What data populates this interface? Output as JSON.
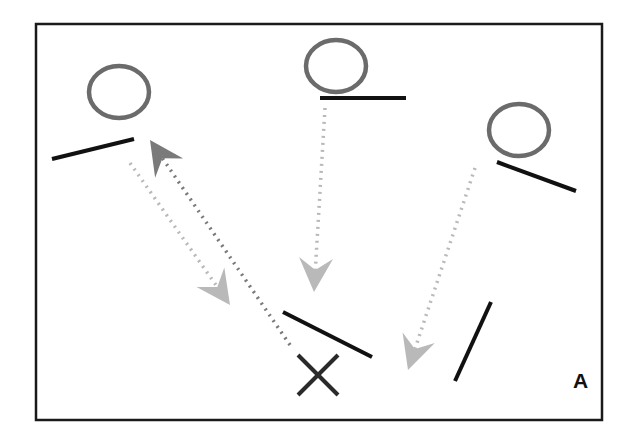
{
  "diagram": {
    "panel_label": "A",
    "colors": {
      "frame": "#1a1a1a",
      "circle": "#6b6b6b",
      "bar": "#111111",
      "arrow_light": "#b9b9b9",
      "arrow_dark": "#7a7a7a",
      "marker": "#2a2a2a"
    },
    "frame": {
      "x": 36,
      "y": 24,
      "w": 566,
      "h": 396
    },
    "circles": [
      {
        "id": "left",
        "cx": 119,
        "cy": 92,
        "rx": 30,
        "ry": 26
      },
      {
        "id": "middle",
        "cx": 336,
        "cy": 66,
        "rx": 30,
        "ry": 26
      },
      {
        "id": "right",
        "cx": 519,
        "cy": 130,
        "rx": 30,
        "ry": 26
      }
    ],
    "bars": [
      {
        "id": "left-bar",
        "x1": 52,
        "y1": 159,
        "x2": 134,
        "y2": 139
      },
      {
        "id": "middle-bar",
        "x1": 320,
        "y1": 98,
        "x2": 406,
        "y2": 98
      },
      {
        "id": "right-bar",
        "x1": 497,
        "y1": 162,
        "x2": 576,
        "y2": 191
      },
      {
        "id": "center-low-bar",
        "x1": 283,
        "y1": 312,
        "x2": 372,
        "y2": 357
      },
      {
        "id": "right-low-bar",
        "x1": 455,
        "y1": 381,
        "x2": 491,
        "y2": 302
      }
    ],
    "arrows": [
      {
        "id": "left-down",
        "tone": "light",
        "x1": 130,
        "y1": 163,
        "x2": 230,
        "y2": 305
      },
      {
        "id": "left-up",
        "tone": "dark",
        "x1": 290,
        "y1": 345,
        "x2": 150,
        "y2": 140
      },
      {
        "id": "middle-down",
        "tone": "light",
        "x1": 325,
        "y1": 108,
        "x2": 314,
        "y2": 292
      },
      {
        "id": "right-down",
        "tone": "light",
        "x1": 475,
        "y1": 168,
        "x2": 408,
        "y2": 370
      }
    ],
    "marker": {
      "id": "x-marker",
      "cx": 318,
      "cy": 375,
      "size": 20
    }
  }
}
